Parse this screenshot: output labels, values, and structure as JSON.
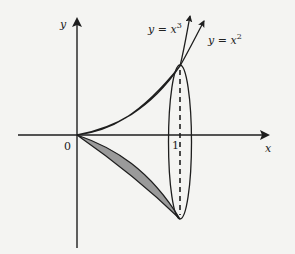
{
  "figure": {
    "axes": {
      "x_label": "x",
      "y_label": "y",
      "origin_label": "0",
      "tick_label": "1"
    },
    "curves": [
      {
        "label": "y = x",
        "exponent": "3",
        "expr": "x^3"
      },
      {
        "label": "y = x",
        "exponent": "2",
        "expr": "x^2"
      }
    ],
    "shaded_region": "area between y = x^2 and y = x^3 for 0 <= x <= 1, revolved about x-axis",
    "colors": {
      "stroke": "#1e1e1e",
      "fill": "#9a9a9a",
      "background": "#f4f4f2"
    }
  }
}
